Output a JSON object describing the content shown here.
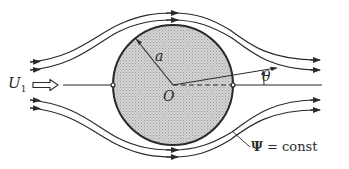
{
  "diagram": {
    "labels": {
      "freestream_symbol": "U",
      "freestream_subscript": "1",
      "radius": "a",
      "origin": "O",
      "angle": "θ",
      "streamfunction_symbol": "Ψ",
      "streamfunction_text": " = const"
    },
    "cylinder": {
      "cx": 173,
      "cy": 85,
      "r": 60,
      "fill": "#c8c8c8",
      "stroke": "#2a2a2a"
    },
    "colors": {
      "line": "#2a2a2a",
      "fill_pattern": "#bdbdbd",
      "background": "#ffffff"
    }
  }
}
